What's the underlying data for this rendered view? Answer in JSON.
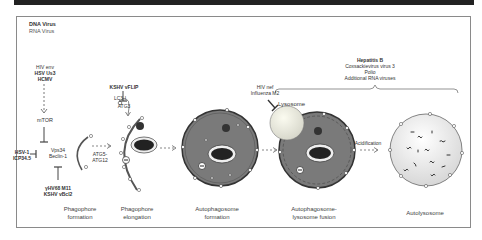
{
  "legend": {
    "dna": "DNA Virus",
    "rna": "RNA Virus"
  },
  "regulators": {
    "mtor_inducers": [
      "HIV env",
      "HSV Us3",
      "HCMV"
    ],
    "mtor": "mTOR",
    "beclin_complex": [
      "Vps34",
      "Beclin-1"
    ],
    "beclin_left_inhibitors": [
      "HSV-1",
      "ICP34.5"
    ],
    "beclin_bottom_inhibitors": [
      "γHV68 M11",
      "KSHV vBcl2"
    ],
    "atg5": [
      "ATG5-",
      "ATG12"
    ],
    "lc3": "LC3-I",
    "vflip": "KSHV vFLIP",
    "atg3": "ATG3",
    "lysosome_inhibitors": [
      "HIV nef",
      "Influenza M2"
    ],
    "lysosome": "Lysosome",
    "fusion_viruses": [
      "Hepatitis B",
      "Coxsackievirus virus 3",
      "Polio",
      "Additional RNA viruses"
    ],
    "acidification": "Acidification"
  },
  "stages": [
    {
      "line1": "Phagophore",
      "line2": "formation"
    },
    {
      "line1": "Phagophore",
      "line2": "elongation"
    },
    {
      "line1": "Autophagosome",
      "line2": "formation"
    },
    {
      "line1": "Autophagosome-",
      "line2": "lysosome fusion"
    },
    {
      "line1": "Autolysosome",
      "line2": ""
    }
  ]
}
